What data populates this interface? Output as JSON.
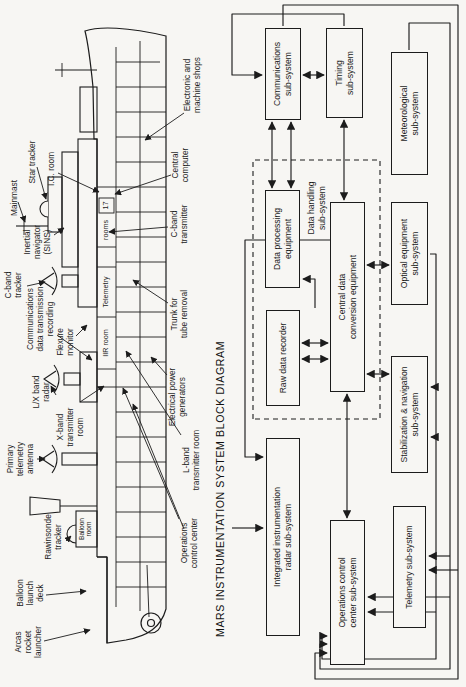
{
  "colors": {
    "ink": "#1c1c1c",
    "paper": "#f7f6f3"
  },
  "title": "MARS INSTRUMENTATION SYSTEM BLOCK DIAGRAM",
  "ship": {
    "callouts": {
      "arcas": {
        "text": "Arcas\nrocket\nlauncher"
      },
      "balloon_deck": {
        "text": "Balloon\nlaunch\ndeck"
      },
      "rawinsonde": {
        "text": "Rawinsonde\ntracker"
      },
      "primary_telemetry": {
        "text": "Primary\ntelemetry\nantenna"
      },
      "lx_band_radar": {
        "text": "L/X band\nradar"
      },
      "xband_room": {
        "text": "X-band\ntransmitter\nroom"
      },
      "cband_tracker": {
        "text": "C-band\ntracker"
      },
      "comms_recording": {
        "text": "Communications\ndata transmission\nrecording"
      },
      "flexure": {
        "text": "Flexure\nmonitor"
      },
      "inertial": {
        "text": "Inertial\nnavigator\n(SINS)"
      },
      "mainmast": {
        "text": "Mainmast"
      },
      "star_tracker": {
        "text": "Star tracker"
      },
      "ic_room": {
        "text": "I.C. room"
      },
      "electronic_shops": {
        "text": "Electronic and\nmachine shops"
      },
      "central_computer": {
        "text": "Central\ncomputer"
      },
      "cband_transmitter": {
        "text": "C-band\ntransmitter"
      },
      "trunk": {
        "text": "Trunk for\ntube removal"
      },
      "power_generators": {
        "text": "Electrical power\ngenerators"
      },
      "lband_room": {
        "text": "L-band\ntransmitter room"
      },
      "ops_center": {
        "text": "Operations\ncontrol center"
      }
    },
    "compartments": {
      "iir_room": {
        "text": "IIR room"
      },
      "telemetry": {
        "text": "Telemetry"
      },
      "rooms": {
        "text": "rooms"
      },
      "room17": {
        "text": "17"
      },
      "balloon_room": {
        "text": "Balloon\nroom"
      }
    }
  },
  "blockdiagram": {
    "boxes": {
      "comm": {
        "label": "Communications\nsub-system"
      },
      "timing": {
        "label": "Timing\nsub-system"
      },
      "meteo": {
        "label": "Meteorological\nsub-system"
      },
      "dataproc": {
        "label": "Data processing\nequipment"
      },
      "cdce": {
        "label": "Central data\nconversion equipment"
      },
      "optical": {
        "label": "Optical equipment\nsub-system"
      },
      "rawrec": {
        "label": "Raw data recorder"
      },
      "stab": {
        "label": "Stabilization & navigation\nsub-system"
      },
      "iir": {
        "label": "Integrated instrumentation\nradar sub-system"
      },
      "ops": {
        "label": "Operations control\ncenter sub-system"
      },
      "telem": {
        "label": "Telemetry sub-system"
      }
    },
    "dashed_group": {
      "label": "Data handling\nsub-system"
    }
  }
}
